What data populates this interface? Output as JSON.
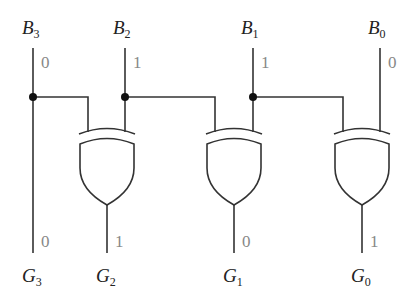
{
  "diagram": {
    "inputs": [
      {
        "name": "B",
        "sub": "3",
        "value": "0"
      },
      {
        "name": "B",
        "sub": "2",
        "value": "1"
      },
      {
        "name": "B",
        "sub": "1",
        "value": "1"
      },
      {
        "name": "B",
        "sub": "0",
        "value": "0"
      }
    ],
    "outputs": [
      {
        "name": "G",
        "sub": "3",
        "value": "0"
      },
      {
        "name": "G",
        "sub": "2",
        "value": "1"
      },
      {
        "name": "G",
        "sub": "1",
        "value": "0"
      },
      {
        "name": "G",
        "sub": "0",
        "value": "1"
      }
    ],
    "gates": [
      {
        "type": "XOR",
        "inputs": [
          "B3",
          "B2"
        ],
        "output": "G2"
      },
      {
        "type": "XOR",
        "inputs": [
          "B2",
          "B1"
        ],
        "output": "G1"
      },
      {
        "type": "XOR",
        "inputs": [
          "B1",
          "B0"
        ],
        "output": "G0"
      }
    ],
    "colors": {
      "wire": "#333333",
      "bit_value": "#888888"
    }
  }
}
